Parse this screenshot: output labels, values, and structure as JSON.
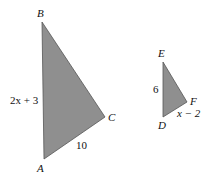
{
  "diagram": {
    "triangle_abc": {
      "vertices": {
        "A": {
          "label": "A",
          "x": 44,
          "y": 159
        },
        "B": {
          "label": "B",
          "x": 42,
          "y": 22
        },
        "C": {
          "label": "C",
          "x": 105,
          "y": 117
        }
      },
      "side_labels": {
        "AB": "2x + 3",
        "AC": "10"
      },
      "fill": "#8f8f8f"
    },
    "triangle_def": {
      "vertices": {
        "D": {
          "label": "D",
          "x": 163,
          "y": 117
        },
        "E": {
          "label": "E",
          "x": 163,
          "y": 62
        },
        "F": {
          "label": "F",
          "x": 187,
          "y": 102
        }
      },
      "side_labels": {
        "DE": "6",
        "DF": "x − 2"
      },
      "fill": "#8f8f8f"
    }
  }
}
